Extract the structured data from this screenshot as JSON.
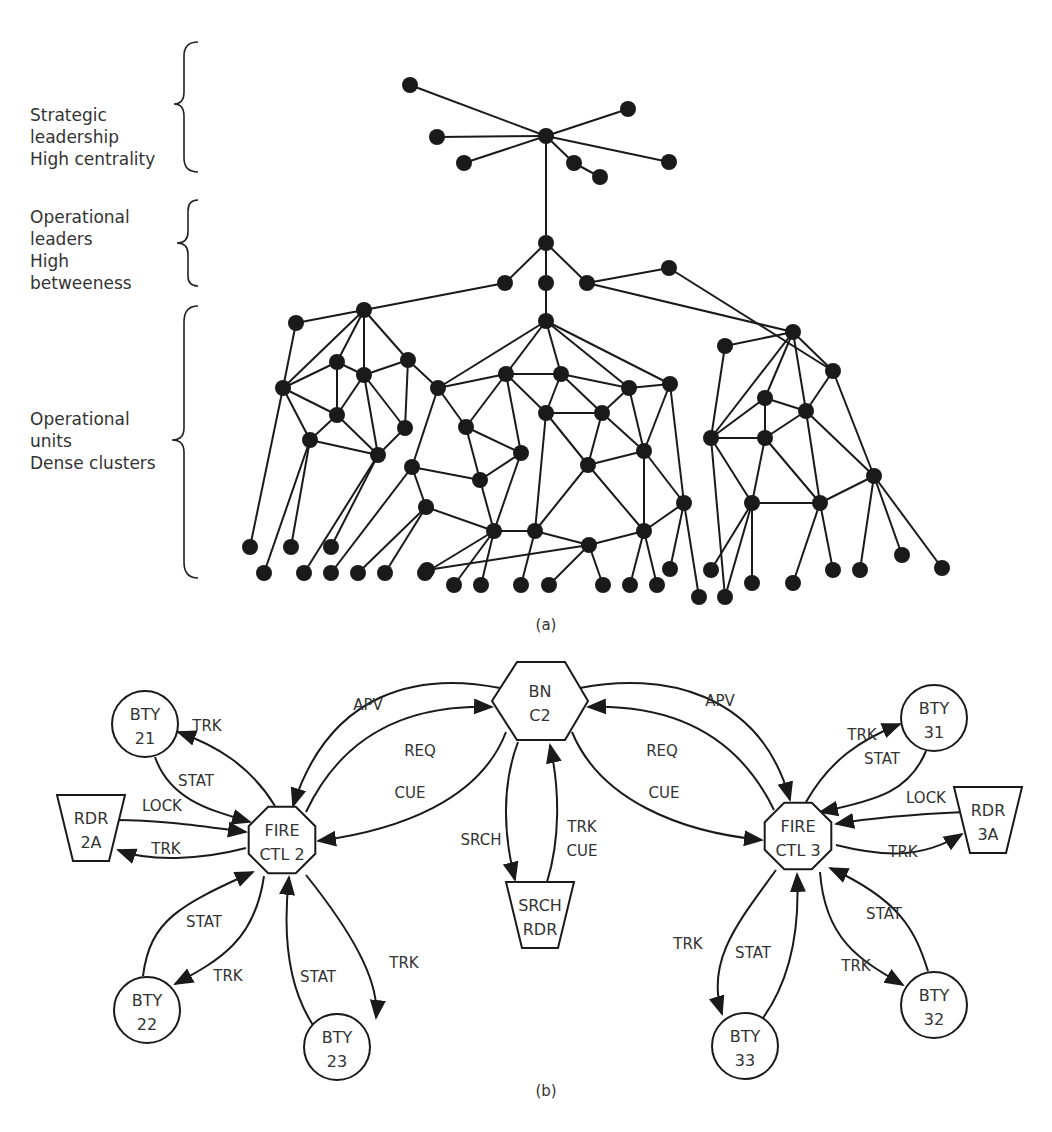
{
  "panel_a": {
    "caption": "(a)",
    "tiers": [
      {
        "id": "strategic",
        "label": "Strategic\nleadership\nHigh centrality"
      },
      {
        "id": "operational-leaders",
        "label": "Operational\nleaders\nHigh\nbetweeness"
      },
      {
        "id": "operational-units",
        "label": "Operational\nunits\nDense clusters"
      }
    ]
  },
  "panel_b": {
    "caption": "(b)",
    "nodes": [
      {
        "id": "bn-c2",
        "shape": "hexagon",
        "lines": [
          "BN",
          "C2"
        ]
      },
      {
        "id": "fire-ctl-2",
        "shape": "octagon",
        "lines": [
          "FIRE",
          "CTL 2"
        ]
      },
      {
        "id": "fire-ctl-3",
        "shape": "octagon",
        "lines": [
          "FIRE",
          "CTL 3"
        ]
      },
      {
        "id": "bty-21",
        "shape": "circle",
        "lines": [
          "BTY",
          "21"
        ]
      },
      {
        "id": "bty-22",
        "shape": "circle",
        "lines": [
          "BTY",
          "22"
        ]
      },
      {
        "id": "bty-23",
        "shape": "circle",
        "lines": [
          "BTY",
          "23"
        ]
      },
      {
        "id": "bty-31",
        "shape": "circle",
        "lines": [
          "BTY",
          "31"
        ]
      },
      {
        "id": "bty-32",
        "shape": "circle",
        "lines": [
          "BTY",
          "32"
        ]
      },
      {
        "id": "bty-33",
        "shape": "circle",
        "lines": [
          "BTY",
          "33"
        ]
      },
      {
        "id": "rdr-2a",
        "shape": "trapezoid",
        "lines": [
          "RDR",
          "2A"
        ]
      },
      {
        "id": "rdr-3a",
        "shape": "trapezoid",
        "lines": [
          "RDR",
          "3A"
        ]
      },
      {
        "id": "srch-rdr",
        "shape": "trapezoid",
        "lines": [
          "SRCH",
          "RDR"
        ]
      }
    ],
    "edges": [
      {
        "from": "bn-c2",
        "to": "fire-ctl-2",
        "label": "APV"
      },
      {
        "from": "fire-ctl-2",
        "to": "bn-c2",
        "label": "REQ"
      },
      {
        "from": "bn-c2",
        "to": "fire-ctl-2",
        "label": "CUE"
      },
      {
        "from": "bn-c2",
        "to": "fire-ctl-3",
        "label": "APV"
      },
      {
        "from": "fire-ctl-3",
        "to": "bn-c2",
        "label": "REQ"
      },
      {
        "from": "bn-c2",
        "to": "fire-ctl-3",
        "label": "CUE"
      },
      {
        "from": "bn-c2",
        "to": "srch-rdr",
        "label": "SRCH"
      },
      {
        "from": "srch-rdr",
        "to": "bn-c2",
        "label": "TRK\nCUE"
      },
      {
        "from": "fire-ctl-2",
        "to": "bty-21",
        "label": "TRK"
      },
      {
        "from": "bty-21",
        "to": "fire-ctl-2",
        "label": "STAT"
      },
      {
        "from": "rdr-2a",
        "to": "fire-ctl-2",
        "label": "LOCK"
      },
      {
        "from": "fire-ctl-2",
        "to": "rdr-2a",
        "label": "TRK"
      },
      {
        "from": "bty-22",
        "to": "fire-ctl-2",
        "label": "STAT"
      },
      {
        "from": "fire-ctl-2",
        "to": "bty-22",
        "label": "TRK"
      },
      {
        "from": "bty-23",
        "to": "fire-ctl-2",
        "label": "STAT"
      },
      {
        "from": "fire-ctl-2",
        "to": "bty-23",
        "label": "TRK"
      },
      {
        "from": "fire-ctl-3",
        "to": "bty-31",
        "label": "TRK"
      },
      {
        "from": "bty-31",
        "to": "fire-ctl-3",
        "label": "STAT"
      },
      {
        "from": "rdr-3a",
        "to": "fire-ctl-3",
        "label": "LOCK"
      },
      {
        "from": "fire-ctl-3",
        "to": "rdr-3a",
        "label": "TRK"
      },
      {
        "from": "fire-ctl-3",
        "to": "bty-33",
        "label": "TRK"
      },
      {
        "from": "bty-33",
        "to": "fire-ctl-3",
        "label": "STAT"
      },
      {
        "from": "fire-ctl-3",
        "to": "bty-32",
        "label": "TRK"
      },
      {
        "from": "bty-32",
        "to": "fire-ctl-3",
        "label": "STAT"
      }
    ]
  }
}
